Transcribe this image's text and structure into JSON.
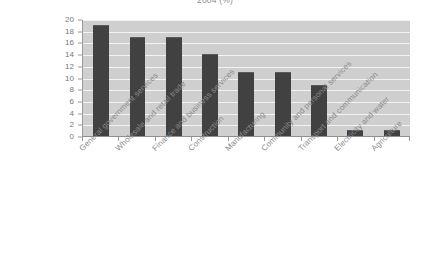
{
  "chart_data": {
    "type": "bar",
    "title": "2004 (%)",
    "xlabel": "",
    "ylabel": "",
    "ylim": [
      0,
      20
    ],
    "ytick_step": 2,
    "yticks": [
      20,
      18,
      16,
      14,
      12,
      10,
      8,
      6,
      4,
      2,
      0
    ],
    "grid": true,
    "legend": false,
    "legend_position": "none",
    "categories": [
      "General government services",
      "Wholesale and retail trade",
      "Finance and business services",
      "Construction",
      "Manufacturing",
      "Community and personal services",
      "Transport and communication",
      "Electricity and water",
      "Agriculture"
    ],
    "values": [
      19,
      17,
      17,
      14,
      11,
      11,
      8.8,
      1,
      1
    ],
    "bar_color": "#414141",
    "plot_background": "#cfcfcf",
    "gridline_color": "#f2f2f2",
    "axis_color": "#9a9a9a",
    "label_color": "#8a8a8a"
  }
}
